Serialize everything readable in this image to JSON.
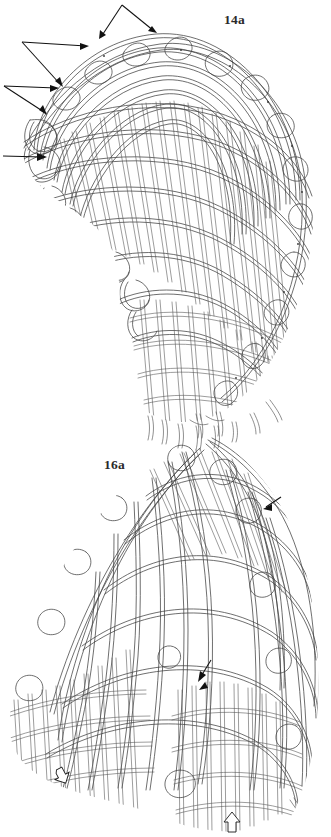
{
  "plate": {
    "kind": "archaeological-line-drawing",
    "background_color": "#ffffff",
    "ink_color": "#3a3a3a",
    "width": 331,
    "height": 837,
    "figures": [
      {
        "id": "fig-14a",
        "label": "14a",
        "label_x": 224,
        "label_y": 12,
        "subject": "twined basketry fragment, domed/oval form shown in three-quarter view",
        "annotations": [
          {
            "name": "double-arrow-top",
            "type": "forked-arrow",
            "heads": 2,
            "apex_x": 122,
            "apex_y": 4,
            "tip1_x": 100,
            "tip1_y": 39,
            "tip2_x": 155,
            "tip2_y": 33
          },
          {
            "name": "double-arrow-upper-left",
            "type": "forked-arrow",
            "heads": 2,
            "apex_x": 22,
            "apex_y": 41,
            "tip1_x": 88,
            "tip1_y": 46,
            "tip2_x": 62,
            "tip2_y": 86
          },
          {
            "name": "double-arrow-left",
            "type": "forked-arrow",
            "heads": 2,
            "apex_x": 4,
            "apex_y": 85,
            "tip1_x": 58,
            "tip1_y": 88,
            "tip2_x": 46,
            "tip2_y": 114
          },
          {
            "name": "single-arrow-lower-left",
            "type": "straight-arrow",
            "heads": 1,
            "tail_x": 3,
            "tail_y": 156,
            "tip_x": 46,
            "tip_y": 157
          }
        ]
      },
      {
        "id": "fig-16a",
        "label": "16a",
        "label_x": 104,
        "label_y": 457,
        "subject": "twined basketry fragment, conical/folded form shown in three-quarter view",
        "annotations": [
          {
            "name": "solid-arrowhead-upper-right",
            "type": "solid-arrowhead",
            "x": 272,
            "y": 503
          },
          {
            "name": "solid-arrowhead-center",
            "type": "solid-arrowhead",
            "x": 203,
            "y": 672
          },
          {
            "name": "hollow-arrow-bottom-left",
            "type": "hollow-arrow",
            "x": 62,
            "y": 775
          },
          {
            "name": "hollow-arrow-bottom-center",
            "type": "hollow-arrow",
            "x": 232,
            "y": 823
          }
        ]
      }
    ]
  }
}
